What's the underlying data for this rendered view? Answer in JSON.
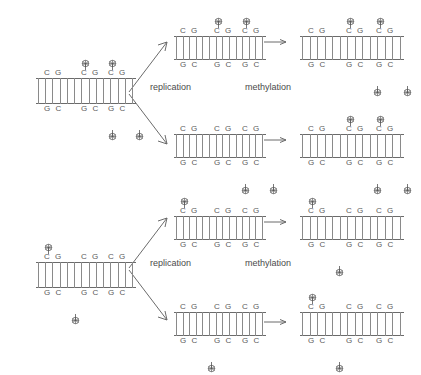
{
  "figure": {
    "background_color": "#ffffff",
    "line_color": "#6b6b6b",
    "text_color": "#4a4a4a"
  },
  "labels": {
    "replication": "replication",
    "methylation": "methylation"
  },
  "bases": {
    "top_strand_pair": "C G",
    "bottom_strand_pair": "G C"
  },
  "icons": {
    "methyl_group": "methyl-group-icon",
    "arrow_right": "arrow-right-icon",
    "arrow_branch_up": "arrow-branch-up-icon",
    "arrow_branch_down": "arrow-branch-down-icon"
  },
  "chart_data": {
    "type": "diagram",
    "cpg_site_count": 3,
    "panels": [
      {
        "id": "row1-parent",
        "role": "parent",
        "row": 1,
        "methylated_top": [
          false,
          true,
          true
        ],
        "methylated_bottom": [
          false,
          true,
          true
        ]
      },
      {
        "id": "row1-daughter-upper",
        "role": "daughter-hemimethylated",
        "row": 1,
        "methylated_top": [
          false,
          true,
          true
        ],
        "methylated_bottom": [
          false,
          false,
          false
        ]
      },
      {
        "id": "row1-daughter-lower",
        "role": "daughter-hemimethylated",
        "row": 1,
        "methylated_top": [
          false,
          false,
          false
        ],
        "methylated_bottom": [
          false,
          true,
          true
        ]
      },
      {
        "id": "row1-product-upper",
        "role": "product-fully-methylated",
        "row": 1,
        "methylated_top": [
          false,
          true,
          true
        ],
        "methylated_bottom": [
          false,
          true,
          true
        ]
      },
      {
        "id": "row1-product-lower",
        "role": "product-fully-methylated",
        "row": 1,
        "methylated_top": [
          false,
          true,
          true
        ],
        "methylated_bottom": [
          false,
          true,
          true
        ]
      },
      {
        "id": "row2-parent",
        "role": "parent",
        "row": 2,
        "methylated_top": [
          true,
          false,
          false
        ],
        "methylated_bottom": [
          true,
          false,
          false
        ]
      },
      {
        "id": "row2-daughter-upper",
        "role": "daughter-hemimethylated",
        "row": 2,
        "methylated_top": [
          true,
          false,
          false
        ],
        "methylated_bottom": [
          false,
          false,
          false
        ]
      },
      {
        "id": "row2-daughter-lower",
        "role": "daughter-hemimethylated",
        "row": 2,
        "methylated_top": [
          false,
          false,
          false
        ],
        "methylated_bottom": [
          true,
          false,
          false
        ]
      },
      {
        "id": "row2-product-upper",
        "role": "product-fully-methylated",
        "row": 2,
        "methylated_top": [
          true,
          false,
          false
        ],
        "methylated_bottom": [
          true,
          false,
          false
        ]
      },
      {
        "id": "row2-product-lower",
        "role": "product-fully-methylated",
        "row": 2,
        "methylated_top": [
          true,
          false,
          false
        ],
        "methylated_bottom": [
          true,
          false,
          false
        ]
      }
    ],
    "layout": {
      "rows": 2,
      "columns": [
        "parent",
        "daughters",
        "products"
      ],
      "step_labels": [
        "replication",
        "methylation"
      ]
    }
  }
}
